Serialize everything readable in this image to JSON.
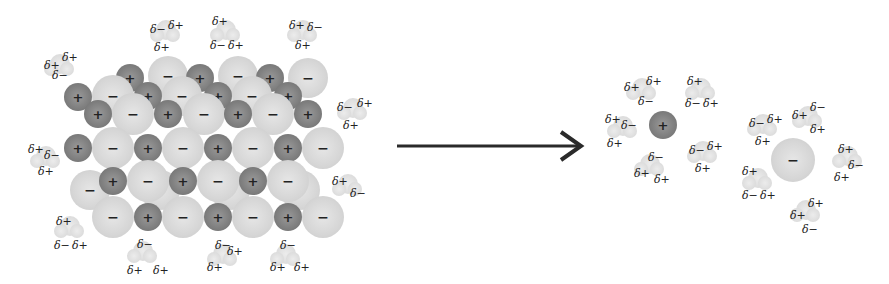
{
  "diagram": {
    "colors": {
      "cation": "#7f7f7f",
      "anion": "#d8d8d8",
      "water": "#e2e2e2",
      "arrow": "#222222",
      "background": "#ffffff"
    },
    "symbols": {
      "cation": "+",
      "anion": "−",
      "delta_plus": "δ+",
      "delta_minus": "δ−"
    },
    "crystal": {
      "label": "Ionic crystal lattice surrounded by water molecules",
      "rows": [
        [
          "+",
          "−",
          "+",
          "−",
          "+",
          "−"
        ],
        [
          "+",
          "−",
          "+",
          "−",
          "+",
          "−",
          "+"
        ],
        [
          "+",
          "−",
          "+",
          "−",
          "+",
          "−",
          "+",
          "−"
        ],
        [
          "+",
          "−",
          "+",
          "−",
          "+",
          "−"
        ],
        [
          "−",
          "+",
          "−",
          "+",
          "−",
          "+",
          "−"
        ]
      ]
    },
    "arrow": {
      "direction": "right",
      "meaning": "dissolution"
    },
    "hydrated_cation": {
      "ion": "+",
      "water_count": 5
    },
    "hydrated_anion": {
      "ion": "−",
      "water_count": 6
    }
  }
}
